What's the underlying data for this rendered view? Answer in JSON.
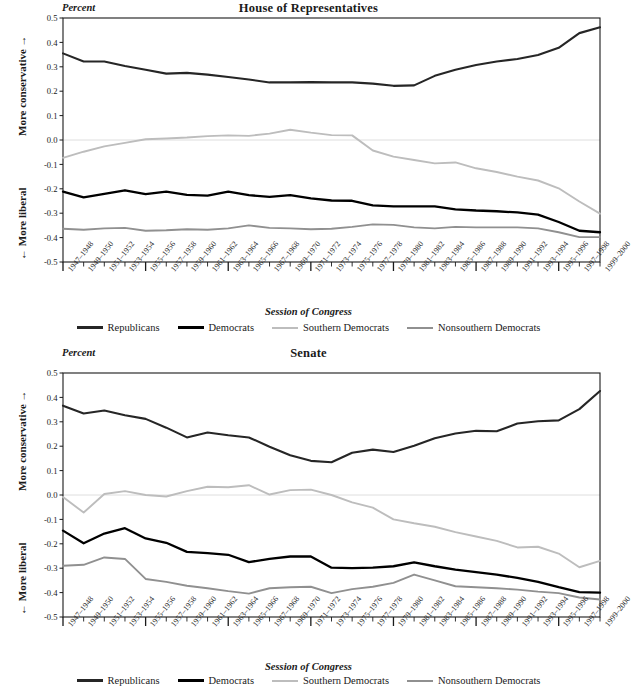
{
  "figure": {
    "xaxis_title": "Session of Congress",
    "percent_label": "Percent",
    "axis_up_label": "More conservative",
    "axis_down_label": "More liberal",
    "arrow_up": "→",
    "arrow_down": "←"
  },
  "legend": {
    "items": [
      {
        "label": "Republicans",
        "color": "#262626",
        "width": 3.0
      },
      {
        "label": "Democrats",
        "color": "#000000",
        "width": 3.4
      },
      {
        "label": "Southern Democrats",
        "color": "#bdbdbd",
        "width": 2.6
      },
      {
        "label": "Nonsouthern Democrats",
        "color": "#909090",
        "width": 2.6
      }
    ]
  },
  "colors": {
    "republicans": "#262626",
    "democrats": "#000000",
    "southern_democrats": "#bdbdbd",
    "nonsouthern_democrats": "#909090",
    "axis": "#1a1a1a",
    "zero_gridline": "#dedede",
    "background": "#ffffff"
  },
  "chart_data": [
    {
      "type": "line",
      "title": "House of Representatives",
      "xlabel": "Session of Congress",
      "ylabel": "Percent",
      "ylim": [
        -0.5,
        0.5
      ],
      "yticks": [
        "0.5",
        "0.4",
        "0.3",
        "0.2",
        "0.1",
        "0.0",
        "-0.1",
        "-0.2",
        "-0.3",
        "-0.4",
        "-0.5"
      ],
      "grid": false,
      "zero_line": true,
      "legend_position": "below",
      "categories": [
        "1947–1948",
        "1949–1950",
        "1951–1952",
        "1953–1954",
        "1955–1956",
        "1957–1958",
        "1959–1960",
        "1961–1962",
        "1963–1964",
        "1965–1966",
        "1967–1968",
        "1969–1970",
        "1971–1972",
        "1973–1974",
        "1975–1976",
        "1977–1978",
        "1979–1980",
        "1981–1982",
        "1983–1984",
        "1985–1986",
        "1987–1988",
        "1989–1990",
        "1991–1992",
        "1993–1994",
        "1995–1996",
        "1997–1998",
        "1999–2000"
      ],
      "series": [
        {
          "name": "Republicans",
          "color": "#262626",
          "values": [
            0.355,
            0.322,
            0.322,
            0.303,
            0.288,
            0.272,
            0.275,
            0.268,
            0.258,
            0.248,
            0.236,
            0.236,
            0.237,
            0.236,
            0.236,
            0.231,
            0.222,
            0.224,
            0.263,
            0.288,
            0.307,
            0.322,
            0.332,
            0.348,
            0.378,
            0.438,
            0.462,
            0.478,
            0.484
          ]
        },
        {
          "name": "Democrats",
          "color": "#000000",
          "values": [
            -0.212,
            -0.235,
            -0.221,
            -0.206,
            -0.222,
            -0.212,
            -0.225,
            -0.228,
            -0.212,
            -0.226,
            -0.233,
            -0.226,
            -0.239,
            -0.248,
            -0.249,
            -0.268,
            -0.272,
            -0.272,
            -0.272,
            -0.284,
            -0.289,
            -0.292,
            -0.297,
            -0.306,
            -0.336,
            -0.372,
            -0.378,
            -0.381
          ]
        },
        {
          "name": "Southern Democrats",
          "color": "#bdbdbd",
          "values": [
            -0.073,
            -0.048,
            -0.026,
            -0.012,
            0.003,
            0.006,
            0.01,
            0.016,
            0.019,
            0.017,
            0.026,
            0.042,
            0.03,
            0.02,
            0.019,
            -0.043,
            -0.068,
            -0.082,
            -0.096,
            -0.092,
            -0.116,
            -0.131,
            -0.15,
            -0.166,
            -0.198,
            -0.252,
            -0.302,
            -0.312
          ]
        },
        {
          "name": "Nonsouthern Democrats",
          "color": "#909090",
          "values": [
            -0.364,
            -0.368,
            -0.362,
            -0.36,
            -0.372,
            -0.37,
            -0.366,
            -0.368,
            -0.362,
            -0.35,
            -0.36,
            -0.362,
            -0.366,
            -0.364,
            -0.356,
            -0.346,
            -0.348,
            -0.358,
            -0.362,
            -0.356,
            -0.358,
            -0.358,
            -0.358,
            -0.362,
            -0.378,
            -0.398,
            -0.398,
            -0.396
          ]
        }
      ]
    },
    {
      "type": "line",
      "title": "Senate",
      "xlabel": "Session of Congress",
      "ylabel": "Percent",
      "ylim": [
        -0.5,
        0.5
      ],
      "yticks": [
        "0.5",
        "0.4",
        "0.3",
        "0.2",
        "0.1",
        "0.0",
        "-0.1",
        "-0.2",
        "-0.3",
        "-0.4",
        "-0.5"
      ],
      "grid": false,
      "zero_line": true,
      "legend_position": "below",
      "categories": [
        "1947–1948",
        "1949–1950",
        "1951–1952",
        "1953–1954",
        "1955–1956",
        "1957–1958",
        "1959–1960",
        "1961–1962",
        "1963–1964",
        "1965–1966",
        "1967–1968",
        "1969–1970",
        "1971–1972",
        "1973–1974",
        "1975–1976",
        "1977–1978",
        "1979–1980",
        "1981–1982",
        "1983–1984",
        "1985–1986",
        "1987–1988",
        "1989–1990",
        "1991–1992",
        "1993–1994",
        "1995–1996",
        "1997–1998",
        "1999–2000"
      ],
      "series": [
        {
          "name": "Republicans",
          "color": "#262626",
          "values": [
            0.366,
            0.334,
            0.346,
            0.327,
            0.312,
            0.276,
            0.236,
            0.256,
            0.245,
            0.236,
            0.198,
            0.163,
            0.14,
            0.134,
            0.173,
            0.186,
            0.176,
            0.202,
            0.233,
            0.252,
            0.263,
            0.261,
            0.293,
            0.302,
            0.306,
            0.352,
            0.426,
            0.416
          ]
        },
        {
          "name": "Democrats",
          "color": "#000000",
          "values": [
            -0.146,
            -0.198,
            -0.158,
            -0.136,
            -0.178,
            -0.196,
            -0.233,
            -0.238,
            -0.245,
            -0.275,
            -0.262,
            -0.252,
            -0.252,
            -0.298,
            -0.3,
            -0.298,
            -0.292,
            -0.276,
            -0.292,
            -0.306,
            -0.316,
            -0.326,
            -0.34,
            -0.356,
            -0.378,
            -0.398,
            -0.4,
            -0.402
          ]
        },
        {
          "name": "Southern Democrats",
          "color": "#bdbdbd",
          "values": [
            -0.008,
            -0.072,
            0.004,
            0.016,
            0.0,
            -0.006,
            0.016,
            0.034,
            0.032,
            0.04,
            0.002,
            0.02,
            0.022,
            0.0,
            -0.03,
            -0.052,
            -0.1,
            -0.116,
            -0.13,
            -0.152,
            -0.17,
            -0.188,
            -0.215,
            -0.212,
            -0.24,
            -0.296,
            -0.27
          ]
        },
        {
          "name": "Nonsouthern Democrats",
          "color": "#909090",
          "values": [
            -0.29,
            -0.286,
            -0.256,
            -0.262,
            -0.344,
            -0.356,
            -0.372,
            -0.382,
            -0.394,
            -0.404,
            -0.382,
            -0.378,
            -0.376,
            -0.402,
            -0.386,
            -0.376,
            -0.36,
            -0.326,
            -0.35,
            -0.374,
            -0.378,
            -0.382,
            -0.388,
            -0.396,
            -0.402,
            -0.42,
            -0.428,
            -0.432
          ]
        }
      ]
    }
  ]
}
